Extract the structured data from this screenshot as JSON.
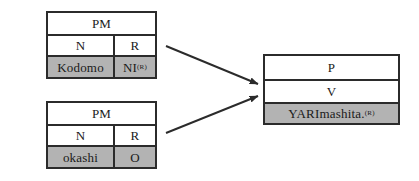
{
  "diagram": {
    "background_color": "#ffffff",
    "line_color": "#2b2b2b",
    "shaded_cell_color": "#b3b3b3",
    "text_color": "#1a1a1a"
  },
  "source_tables": [
    {
      "id": "source-1",
      "header_label": "PM",
      "feature_labels": [
        "N",
        "R"
      ],
      "value_labels": [
        "Kodomo",
        "NI"
      ],
      "value_superscripts": [
        "",
        "(R)"
      ],
      "shaded_row_index": 2
    },
    {
      "id": "source-2",
      "header_label": "PM",
      "feature_labels": [
        "N",
        "R"
      ],
      "value_labels": [
        "okashi",
        "O"
      ],
      "value_superscripts": [
        "",
        ""
      ],
      "shaded_row_index": 2
    }
  ],
  "result_table": {
    "id": "result",
    "rows": [
      "P",
      "V",
      "YARImashita."
    ],
    "value_superscript": "(R)",
    "shaded_row_index": 2
  },
  "arrows": [
    {
      "name": "arrow-source-1-to-result",
      "from": "source-1",
      "to": "result"
    },
    {
      "name": "arrow-source-2-to-result",
      "from": "source-2",
      "to": "result"
    }
  ]
}
